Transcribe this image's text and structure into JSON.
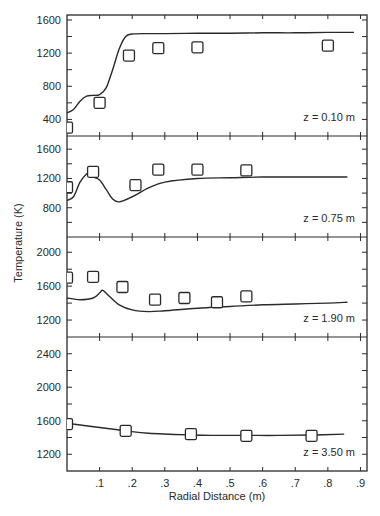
{
  "chart_data": {
    "type": "line",
    "xlabel": "Radial Distance (m)",
    "ylabel": "Temperature (K)",
    "xlim": [
      0,
      0.92
    ],
    "x_ticks": [
      0.1,
      0.2,
      0.3,
      0.4,
      0.5,
      0.6,
      0.7,
      0.8,
      0.9
    ],
    "x_tick_labels": [
      ".1",
      ".2",
      ".3",
      ".4",
      ".5",
      ".6",
      ".7",
      ".8",
      ".9"
    ],
    "grid": false,
    "legend": null,
    "panels": [
      {
        "annotation": "z = 0.10 m",
        "ylim": [
          200,
          1660
        ],
        "y_ticks": [
          400,
          800,
          1200,
          1600
        ],
        "y_tick_labels": [
          "400",
          "800",
          "1200",
          "1600"
        ],
        "line": {
          "x": [
            0.0,
            0.02,
            0.04,
            0.06,
            0.08,
            0.1,
            0.12,
            0.14,
            0.16,
            0.18,
            0.2,
            0.25,
            0.3,
            0.4,
            0.5,
            0.6,
            0.7,
            0.8,
            0.88
          ],
          "y": [
            480,
            520,
            620,
            680,
            690,
            700,
            780,
            1000,
            1250,
            1400,
            1430,
            1435,
            1435,
            1440,
            1440,
            1445,
            1445,
            1450,
            1450
          ]
        },
        "points": {
          "x": [
            0.0,
            0.1,
            0.19,
            0.28,
            0.4,
            0.8
          ],
          "y": [
            300,
            600,
            1170,
            1260,
            1270,
            1290
          ]
        }
      },
      {
        "annotation": "z = 0.75 m",
        "ylim": [
          400,
          1780
        ],
        "y_ticks": [
          800,
          1200,
          1600
        ],
        "y_tick_labels": [
          "800",
          "1200",
          "1600"
        ],
        "line": {
          "x": [
            0.0,
            0.02,
            0.04,
            0.06,
            0.07,
            0.08,
            0.1,
            0.12,
            0.14,
            0.16,
            0.2,
            0.25,
            0.3,
            0.4,
            0.5,
            0.6,
            0.7,
            0.8,
            0.86
          ],
          "y": [
            900,
            950,
            1150,
            1260,
            1270,
            1220,
            1180,
            1050,
            920,
            880,
            950,
            1070,
            1150,
            1200,
            1210,
            1220,
            1220,
            1220,
            1220
          ]
        },
        "points": {
          "x": [
            0.0,
            0.08,
            0.21,
            0.28,
            0.4,
            0.55
          ],
          "y": [
            1080,
            1290,
            1110,
            1320,
            1320,
            1310
          ]
        }
      },
      {
        "annotation": "z = 1.90 m",
        "ylim": [
          1000,
          2180
        ],
        "y_ticks": [
          1200,
          1600,
          2000
        ],
        "y_tick_labels": [
          "1200",
          "1600",
          "2000"
        ],
        "line": {
          "x": [
            0.0,
            0.04,
            0.08,
            0.1,
            0.11,
            0.13,
            0.16,
            0.2,
            0.25,
            0.3,
            0.4,
            0.5,
            0.6,
            0.7,
            0.8,
            0.86
          ],
          "y": [
            1460,
            1440,
            1460,
            1520,
            1550,
            1480,
            1380,
            1320,
            1300,
            1310,
            1340,
            1360,
            1380,
            1390,
            1400,
            1410
          ]
        },
        "points": {
          "x": [
            0.0,
            0.08,
            0.17,
            0.27,
            0.36,
            0.46,
            0.55
          ],
          "y": [
            1700,
            1710,
            1590,
            1440,
            1460,
            1410,
            1480
          ]
        }
      },
      {
        "annotation": "z = 3.50 m",
        "ylim": [
          1000,
          2600
        ],
        "y_ticks": [
          1200,
          1600,
          2000,
          2400
        ],
        "y_tick_labels": [
          "1200",
          "1600",
          "2000",
          "2400"
        ],
        "line": {
          "x": [
            0.0,
            0.1,
            0.18,
            0.25,
            0.38,
            0.45,
            0.55,
            0.65,
            0.75,
            0.85
          ],
          "y": [
            1570,
            1520,
            1480,
            1450,
            1430,
            1425,
            1425,
            1425,
            1430,
            1440
          ]
        },
        "points": {
          "x": [
            0.0,
            0.18,
            0.38,
            0.55,
            0.75
          ],
          "y": [
            1560,
            1480,
            1440,
            1420,
            1420
          ]
        }
      }
    ]
  },
  "style": {
    "ink": "#2a2a2a",
    "background": "#ffffff"
  }
}
